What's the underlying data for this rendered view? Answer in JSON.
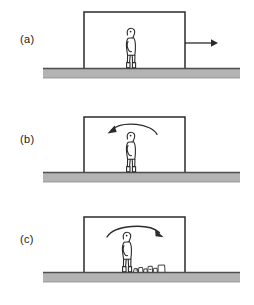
{
  "figure": {
    "type": "physics-diagram",
    "background_color": "#ffffff",
    "ink_color": "#2b2b2b",
    "ground_fill_color": "#b3b3b3",
    "ground_edge_color": "#4d4d4d",
    "panels": [
      {
        "id": "a",
        "label": "(a)",
        "frame": {
          "left": 84,
          "right": 185,
          "top": 12,
          "bottom": 68
        },
        "ground": {
          "left": 43,
          "right": 240,
          "top": 68,
          "thickness": 10
        },
        "person": {
          "x": 131,
          "feet_y": 68,
          "height": 40,
          "facing": "right"
        },
        "straight_arrow": {
          "from_x": 185,
          "to_x": 216,
          "y": 43,
          "direction": "right",
          "visible": true
        },
        "curved_arrow": {
          "visible": false,
          "direction": "none"
        },
        "debris_pile": {
          "visible": false
        }
      },
      {
        "id": "b",
        "label": "(b)",
        "frame": {
          "left": 84,
          "right": 185,
          "top": 17,
          "bottom": 72
        },
        "ground": {
          "left": 43,
          "right": 240,
          "top": 72,
          "thickness": 10
        },
        "person": {
          "x": 131,
          "feet_y": 72,
          "height": 40,
          "facing": "right"
        },
        "straight_arrow": {
          "visible": false
        },
        "curved_arrow": {
          "from_x": 155,
          "to_x": 108,
          "apex_y": 24,
          "end_y": 35,
          "direction": "left",
          "visible": true
        },
        "debris_pile": {
          "visible": false
        }
      },
      {
        "id": "c",
        "label": "(c)",
        "frame": {
          "left": 84,
          "right": 185,
          "top": 17,
          "bottom": 72
        },
        "ground": {
          "left": 43,
          "right": 240,
          "top": 72,
          "thickness": 10
        },
        "person": {
          "x": 127,
          "feet_y": 72,
          "height": 40,
          "facing": "right"
        },
        "straight_arrow": {
          "from_x": 185,
          "to_x": 216,
          "y": 46,
          "direction": "right",
          "visible": true
        },
        "curved_arrow": {
          "from_x": 110,
          "to_x": 162,
          "apex_y": 26,
          "end_y": 37,
          "direction": "right",
          "visible": true
        },
        "debris_pile": {
          "visible": true,
          "left": 136,
          "right": 166,
          "top": 64,
          "bottom": 72
        }
      }
    ]
  }
}
